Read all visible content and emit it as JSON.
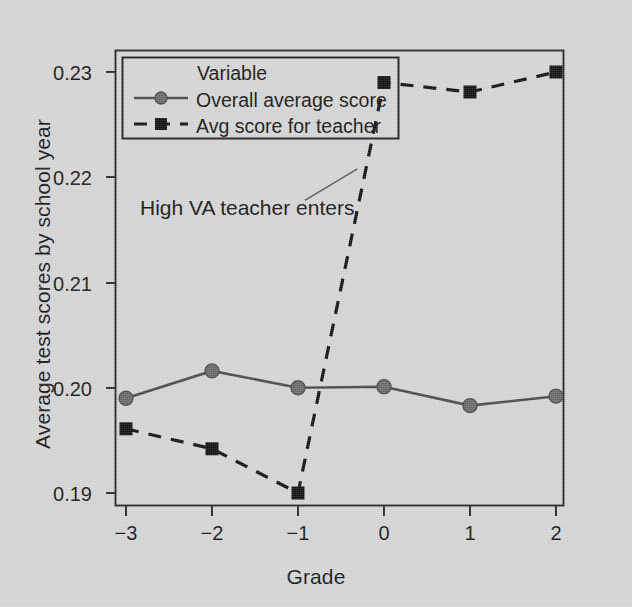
{
  "chart_data": {
    "type": "line",
    "title": "",
    "subtitle": "",
    "xlabel": "Grade",
    "ylabel": "Average test scores by school year",
    "x": [
      -3,
      -2,
      -1,
      0,
      1,
      2
    ],
    "xtick_labels": [
      "−3",
      "−2",
      "−1",
      "0",
      "1",
      "2"
    ],
    "ytick_labels": [
      "0.19",
      "0.20",
      "0.21",
      "0.22",
      "0.23"
    ],
    "ytick_values": [
      0.19,
      0.2,
      0.21,
      0.22,
      0.23
    ],
    "xlim": [
      -3.35,
      2.1
    ],
    "ylim": [
      0.1885,
      0.2313
    ],
    "grid": false,
    "legend_position": "top-left-inside",
    "legend_title": "Variable",
    "series": [
      {
        "name": "Overall average score",
        "marker": "circle",
        "linestyle": "solid",
        "color": "#4a4a4a",
        "values": [
          0.199,
          0.2016,
          0.2,
          0.2001,
          0.1983,
          0.1992
        ]
      },
      {
        "name": "Avg score for teacher",
        "marker": "square",
        "linestyle": "dashed",
        "color": "#111111",
        "values": [
          0.1961,
          0.1942,
          0.19,
          0.229,
          0.2281,
          0.23
        ]
      }
    ],
    "annotations": [
      {
        "text": "High VA teacher enters",
        "x": -1.72,
        "y": 0.2155,
        "leader_line": {
          "x1": -0.92,
          "y1": 0.2178,
          "x2": -0.31,
          "y2": 0.2208
        }
      }
    ]
  },
  "colors": {
    "background": "#d6d6d6",
    "axis": "#2a2a2a",
    "text": "#161616",
    "series_overall": "#4a4a4a",
    "series_teacher": "#111111"
  }
}
